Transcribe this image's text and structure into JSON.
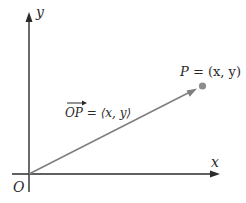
{
  "diagram": {
    "type": "vector-position-diagram",
    "axes": {
      "x_label": "x",
      "y_label": "y",
      "origin_label": "O"
    },
    "point": {
      "name": "P",
      "equals": "=",
      "coords": "(x, y)"
    },
    "vector": {
      "name": "OP",
      "equals": "=",
      "components": "⟨x, y⟩"
    },
    "colors": {
      "axis": "#2b2b2b",
      "vector": "#7f7f7f",
      "point": "#8c8c8c",
      "text": "#2a2a2a"
    },
    "icons": {
      "x_axis_arrow": "arrowhead-right",
      "y_axis_arrow": "arrowhead-up",
      "vector_arrow": "arrowhead",
      "point_marker": "dot"
    }
  }
}
